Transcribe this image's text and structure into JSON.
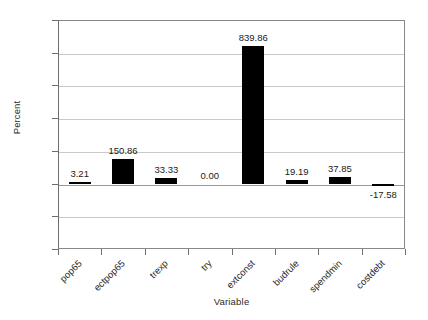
{
  "chart_data": {
    "type": "bar",
    "title": "",
    "xlabel": "Variable",
    "ylabel": "Percent",
    "categories": [
      "pop65",
      "ectpop65",
      "trexp",
      "try",
      "extconst",
      "budrule",
      "spendmin",
      "costdebt"
    ],
    "values": [
      3.21,
      150.86,
      33.33,
      0.0,
      839.86,
      19.19,
      37.85,
      -17.58
    ],
    "value_labels": [
      "3.21",
      "150.86",
      "33.33",
      "0.00",
      "839.86",
      "19.19",
      "37.85",
      "-17.58"
    ],
    "ylim": [
      -400,
      1000
    ],
    "ytick_values": [
      1000,
      800,
      600,
      400,
      200,
      0,
      -200,
      -400
    ],
    "ytick_labels": [
      "1000",
      "800",
      "600",
      "400",
      "200",
      "0",
      "-200",
      "-400"
    ],
    "grid": true,
    "legend": false,
    "bar_color": "#000000",
    "gridline_color": "#c9c9c9",
    "axis_color": "#6e6e6e"
  }
}
